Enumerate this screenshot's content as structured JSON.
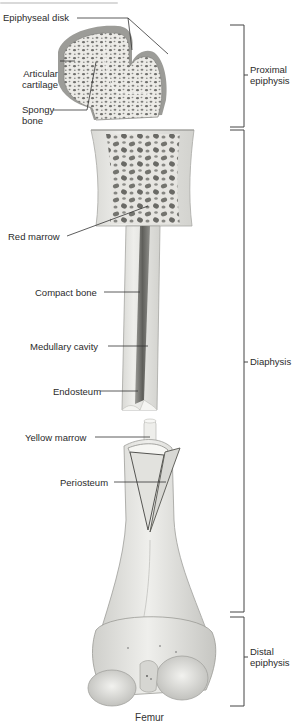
{
  "figure": {
    "caption": "Femur",
    "colors": {
      "bone_light": "#e9e9e6",
      "bone_mid": "#cfcfcb",
      "bone_dark": "#8d8d8a",
      "cartilage": "#9a9a9a",
      "cavity": "#6e6e6b",
      "line": "#333333"
    }
  },
  "labels_left": [
    {
      "id": "epiphyseal-disk",
      "text": "Epiphyseal disk"
    },
    {
      "id": "articular-cartilage",
      "text": "Articular cartilage"
    },
    {
      "id": "spongy-bone",
      "text": "Spongy bone"
    },
    {
      "id": "red-marrow",
      "text": "Red marrow"
    },
    {
      "id": "compact-bone",
      "text": "Compact bone"
    },
    {
      "id": "medullary-cavity",
      "text": "Medullary cavity"
    },
    {
      "id": "endosteum",
      "text": "Endosteum"
    },
    {
      "id": "yellow-marrow",
      "text": "Yellow marrow"
    },
    {
      "id": "periosteum",
      "text": "Periosteum"
    }
  ],
  "labels_right": [
    {
      "id": "proximal-epiphysis",
      "text": "Proximal epiphysis"
    },
    {
      "id": "diaphysis",
      "text": "Diaphysis"
    },
    {
      "id": "distal-epiphysis",
      "text": "Distal epiphysis"
    }
  ],
  "label_lines": {
    "articular_1": "Articular",
    "articular_2": "cartilage",
    "spongy_1": "Spongy",
    "spongy_2": "bone",
    "proximal_1": "Proximal",
    "proximal_2": "epiphysis",
    "distal_1": "Distal",
    "distal_2": "epiphysis"
  }
}
